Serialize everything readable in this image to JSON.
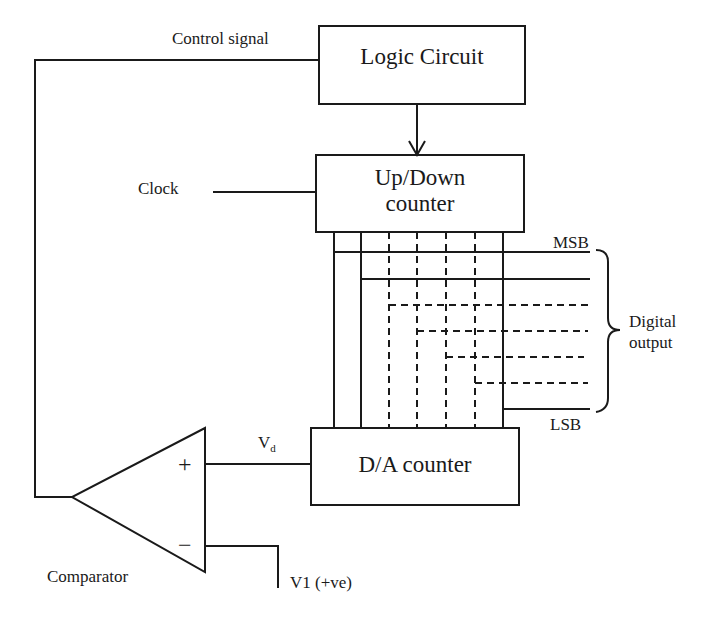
{
  "diagram": {
    "blocks": {
      "logic_circuit": "Logic Circuit",
      "updown_counter_line1": "Up/Down",
      "updown_counter_line2": "counter",
      "da_counter": "D/A counter",
      "comparator": "Comparator"
    },
    "labels": {
      "control_signal": "Control signal",
      "clock": "Clock",
      "msb": "MSB",
      "lsb": "LSB",
      "digital_output_line1": "Digital",
      "digital_output_line2": "output",
      "vd_main": "V",
      "vd_sub": "d",
      "v1": "V1 (+ve)",
      "plus": "+",
      "minus": "−"
    },
    "bits": {
      "count_shown": 7,
      "solid_lines": [
        "bit 1 (MSB)",
        "bit 2",
        "bit n (LSB)"
      ],
      "dashed_lines": [
        "bit 3",
        "bit 4",
        "bit 5",
        "bit 6"
      ]
    },
    "colors": {
      "line": "#1a1a1a",
      "background": "#ffffff"
    }
  }
}
